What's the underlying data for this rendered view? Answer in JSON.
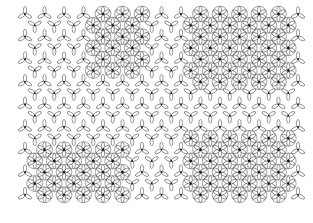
{
  "figure": {
    "background": "#ffffff",
    "stroke_color": "#333333",
    "star_color": "#111111",
    "bounds": {
      "x0": 25,
      "y0": 14,
      "x1": 298,
      "y1": 196
    },
    "lattice": {
      "dx": 19.5,
      "dy": 11.3,
      "lobe_len": 7.5,
      "lobe_w": 3.2
    },
    "dense_regions": [
      {
        "name": "top-middle",
        "x0": 92,
        "y0": 12,
        "x1": 148,
        "y1": 72
      },
      {
        "name": "top-right",
        "x0": 188,
        "y0": 12,
        "x1": 292,
        "y1": 86
      },
      {
        "name": "bottom-left",
        "x0": 28,
        "y0": 140,
        "x1": 128,
        "y1": 197
      },
      {
        "name": "bottom-right",
        "x0": 182,
        "y0": 132,
        "x1": 292,
        "y1": 197
      }
    ]
  }
}
